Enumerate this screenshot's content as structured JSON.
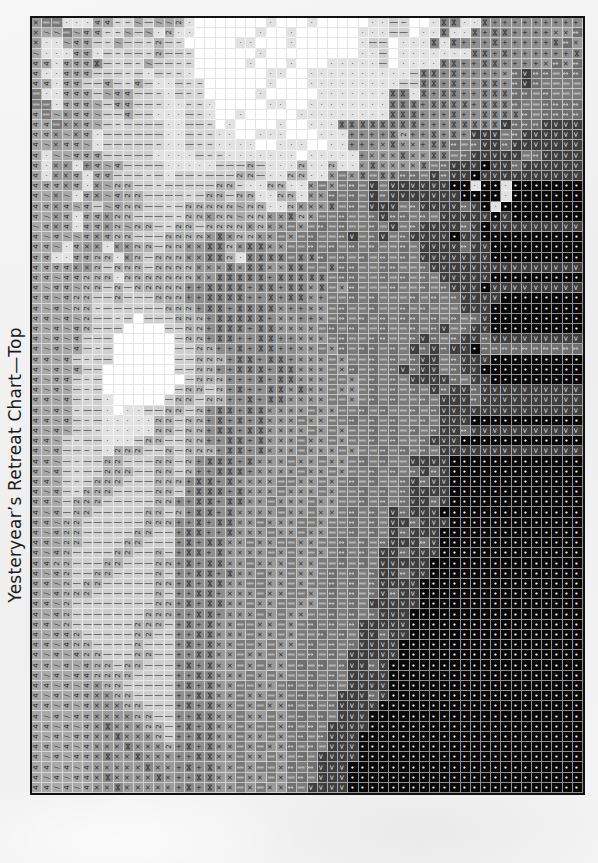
{
  "title": "Yesteryear’s Retreat Chart—Top",
  "chart": {
    "columns": 54,
    "rows": 76,
    "symbol_key": {
      "w": {
        "glyph": "",
        "shade": "#ffffff",
        "cls": "s-w"
      },
      ".": {
        "glyph": "·",
        "shade": "#e2e2e2",
        "cls": "s-dot"
      },
      "~": {
        "glyph": "≀",
        "shade": "#d6d6d6",
        "cls": "s-sq"
      },
      "|": {
        "glyph": "│",
        "shade": "#cfcfcf",
        "cls": "s-bar"
      },
      "/": {
        "glyph": "/",
        "shade": "#a9a9a9",
        "cls": "s-sl"
      },
      "4": {
        "glyph": "4",
        "shade": "#a6a6a6",
        "cls": "s-4"
      },
      "x": {
        "glyph": "×",
        "shade": "#9a9a9a",
        "cls": "s-x"
      },
      "z": {
        "glyph": "2",
        "shade": "#b2b2b2",
        "cls": "s-2"
      },
      "+": {
        "glyph": "+",
        "shade": "#8f8f8f",
        "cls": "s-plus"
      },
      "n": {
        "glyph": "⋈",
        "shade": "#8a8a8a",
        "cls": "s-bt"
      },
      "=": {
        "glyph": "‖",
        "shade": "#7b7b7b",
        "cls": "s-eq"
      },
      "-": {
        "glyph": "↕",
        "shade": "#6f6f6f",
        "cls": "s-ar"
      },
      "A": {
        "glyph": "<",
        "shade": "#3e3e3e",
        "cls": "s-A"
      },
      "o": {
        "glyph": "•",
        "shade": "#080808",
        "cls": "s-o"
      }
    },
    "grid_rows": [
      "x==...44~~/|//z.wwwwwww.www.wwwww..|~ww.nn..n+++++++++n-A",
      "x//=/44~~/|/.z..wwwwww.ww.wwwwww...||w..n..n+nn++++xx-=",
      "x../44|~/||~z|~wwwww..www.wwwwww.||w...n.n+++n+++++n-xx",
      "/...44.|~||~z||~wwwwww.wwwwwwwww..|w.......nn+n++++++n--",
      "44.444n|~|~/||~~wwwww.www.www.....|w....nn++nn++++x-x-",
      "4..444|||~|.|~~.wwwwwww..ww..........|nn+n++++x-A--=-",
      "44.44||4|~4|..|~~wwwwww.www.........||nn+n++nn+-A-===",
      "=..444|/44||~.|~~wwwww.wwwww.......nn.n+nn++nnn--=-=",
      "==.444/|44||~..~~.wwwww..ww........nnn+nnnn+nnn-==-",
      "4=/x44/||4||...|~.ww.wwwww.........nnn+++n++nnnn-=-",
      "44=xx4/|~||||..||~w.wwww.ww...nnnnnnnn+++nnnnnA---A",
      "44x/x4.||||||..|~~..ww...www...++++nz++n+n+AAA=-AA",
      "4/x44/.|||||~..|~~....ww...ww..+++xnxx+nn-=-AA-AA",
      "4.//444|||||....|~~.......w.....+xxxnxxnn=-AAAAA=-A",
      "4.xx.+4/4||||.....|||z|...z..z..xnxxxxn=-AAAoAA-A",
      "4.xx4.44|||~|.||~|||zz|..zz..x=xn=nn--=A-AAoAAAA",
      "444x4.x/zz||~|||||zz~..zz..x=x=-=A=AAAAAAoo.oo.o",
      "4/x/.4x/4zz||||~|zz|zz..zz.xx-=-=A-AAAAAAAoooo.oo",
      "44x4/4|/4zz||~|zzzzz/zz..zxxxn=-=AAA=-AAAA-Ao.oo",
      "4/x4.44xzz||||~zzxzz/zzxxnzx==-==-A--=-=AAAAAoAo",
      "/4x4.44xz/zz|~zz|zzzzxzxx=x=-=-==-=A=-AAAA-AoAA",
      "4/4//4x4zz|||zzzzxnxzzxx=x=-==-A=-A=-AAAAoAAoo",
      "44/.4xx.xxzz|zzxxnnzxnnxx==-=-=-=-==-=AAAA-AAo",
      "44..44zz.xz|zzzxxnnz.nnnn=nn-=-=-=-=-=AAAAAAAo",
      "4444xxz|zzz|zzzzxxxnxnnxxnn==n--==--==-AAAAAAA",
      "44/44zzz.zzzzzzzxxnnnnn+nnnnn=--==-=-=-=AAAAAo",
      "4/44/zz|z|zzzzz++nnnn+nn+nnxn=x-===-==-=-AAAoA",
      "44/4zz||z|||zzz++nnnn++n+nnx+==-=-===-=-=-AAAAo",
      "4/4/zz~||||||zzz+nn+nnnnx++xx=-==-==-=-===AAAoo",
      "44/4/z||~|w|||zzz+nnnnn+xx++x=-=-=-=--=-=-=-Ao",
      "4/4/4z|||wwww||zz+nnn+nnxxxx=-=-==-==-=-A=-AAo",
      "4/4/4|||wwwwww|zz+nn++nn++xxx=-==--==-A-=-AA-A",
      "4/4/4|~|wwwwww||zz++n+nn++xx=x-=--=-=A-A-AAo-",
      "44/4|~||wwwwww||zzz+nn+nn+xxx=x==-=-=-AA=-AAAo",
      "4/4/4||wwwwwww||zz++nnn+nnxxx=x-=-=-A-AA=-AAoo",
      "4/44|~|wwwwwwww|zzz+++n+nnxxx==x=-=-=AAAA-=AAo",
      "4/4/|~|wwwwwww|zz|z+n++nnxnxx=xx=-=-=-=A-AA-A",
      "44/4|~|.wwwww|zz|zz++n+nnxxxx==x=-=-==-=AAA-A",
      "4/4/~||.w..||zz|z+nn+nnxxxx=xx==-=-==-=-AAAA",
      "44/4|~|.....zz|zz+n+n+nxxx=xx==-=-=-==-=AAAo",
      "4/4/||~.....zz|zz+nn+nnxxxx=x=x==-=-=-=-AA-A",
      "44/|~||...|zz||zz++nn+nxxx=xx=x==-=-==-AAAo",
      "4/4||~|.zzz||z|zzz+nn+nxxx=xxx=x==-=-=-=AAA",
      "44/|~||zz|||zz|z+nnn+nxxx=xx=xx=-=-==AAAAo",
      "4/4|~||zzz||zz|z++nnn+xxxx=xx=x==-=-=-A-Ao",
      "44/|~|zzz|||zzz+nn+nxxxx==xx=x=-=-==-A-AAo",
      "4/4|~zzz||||zz|+nnn+nxxx=xxx=x==-=-=-AAAAo",
      "44/|zzz|||||zz++nn+nnxx=xxx=xx==-=-=-AA-Ao",
      "4/4|zz|||||zz|z+nn+nxxxx=xx=xx=-=-=A-AAAoo",
      "44/zz||||||zzz++n+nnxx=xxx==x==-=-=AA-AAAo",
      "4/4zz|||||zz||+nn++nxxx=xx=xx==-=-=A-AAAoo",
      "44/zz||||zz|||+n+nnxx=xx==xx==-=-=-AAA-Aoo",
      "4/4z||||zz||z|+nn+nxxxx=x=x=x=-=-=AA-AAAoo",
      "44zz|||zz|||zz+n+nnxx=xxx=xx==-=-=AAAAAoo",
      "4/4z||zz||||z|++nn+nxx=xx=xx=-=-=-AA-AAoo",
      "44/z|zz|||||zz+n+nnxx==xx=x==-=-=-AAAAoo",
      "4/4zzz||||||z|++nn+xxx=xx==x=-=-=-A-AAoo",
      "44/z||||||||zz+n+nnxx=xx==xx=-=-=AAAAAoo",
      "4/4z|||||||zzz++nn+xxx=x=xx==-=-=-AAAoo",
      "44/z||||||zzz|+n+nxx==xx=x=-=-=-AAAAAoo",
      "4/44z|||||zz||++nnxxx=xx=x==-=-=AA-AAoo",
      "44/4zz||||z|||+n+nxx==x=xx=-=-=-AAAAoo",
      "4/4/4zz|||zz||++nnxx=xx=x==-=-=AAAAAoo",
      "44/4/4zz|zz|||+n+nxx=x=xx=-=-=-AA-Aoo",
      "4/4/44zzzz||||++nnxxx=x=x==-=-=AAAAoo",
      "44/4/4xzz|||||+n+nxx==xx=-=-=-=AAAAoo",
      "4/4/44xxzz||||++nnxx=xx=x=-=-=AAA-Aoo",
      "44/4/4xxxzz|||+n+nxx=x=xx-=-=-AAAAoo",
      "4/4/44xxxxzz||++nnxx=xx=x=-=-=AAAoo",
      "44/4/4xnxxxzz|+n+nxx=x==x-=-=AAAAoo",
      "4/4/44xxnxxxz|++nnxx=xx=x=-=-AAAoo",
      "44/4/4xxxnxxxz+n+nxx=x=xx-=-=AAAoo",
      "4/4/44xnxxnxxx++nnxx=xx=x=-=AAAAoo",
      "44/4/4xxxxxnxx+n+nxx=x==x-=-AAAoo",
      "4/4/44xnxxxxnx++nnxx=xx=x=-=AAAoo",
      "44/4/4xxnxxxxx+n+nxx=x=xx-=AAAAoo"
    ]
  }
}
